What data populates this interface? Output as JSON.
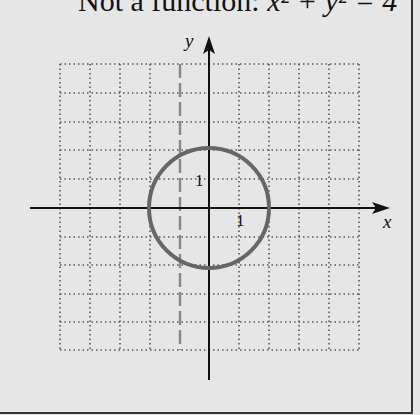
{
  "title": {
    "prefix": "Not a function: ",
    "equation": "x² + y² = 4"
  },
  "axes": {
    "x_label": "x",
    "y_label": "y",
    "x_tick_label": "1",
    "y_tick_label": "1"
  },
  "grid": {
    "x_range": [
      -5,
      5
    ],
    "y_range": [
      -5,
      5
    ],
    "style": "dotted"
  },
  "curve": {
    "type": "circle",
    "center": [
      0,
      0
    ],
    "radius": 2,
    "color": "#666666"
  },
  "vertical_line_test": {
    "x": -1,
    "style": "dashed",
    "color": "#888888"
  },
  "colors": {
    "background": "#e6e6e6",
    "axis": "#111111",
    "grid": "#555555"
  }
}
